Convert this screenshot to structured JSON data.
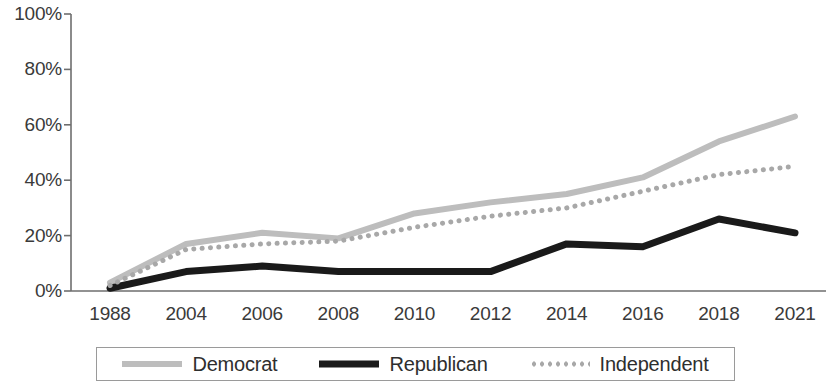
{
  "chart_data": {
    "type": "line",
    "title": "",
    "subtitle": "",
    "xlabel": "",
    "ylabel": "",
    "categories": [
      "1988",
      "2004",
      "2006",
      "2008",
      "2010",
      "2012",
      "2014",
      "2016",
      "2018",
      "2021"
    ],
    "x": [
      1988,
      2004,
      2006,
      2008,
      2010,
      2012,
      2014,
      2016,
      2018,
      2021
    ],
    "ylim": [
      0,
      100
    ],
    "ytick_labels": [
      "0%",
      "20%",
      "40%",
      "60%",
      "80%",
      "100%"
    ],
    "ytick_values": [
      0,
      20,
      40,
      60,
      80,
      100
    ],
    "grid": false,
    "legend_position": "bottom",
    "value_suffix": "%",
    "series": [
      {
        "name": "Democrat",
        "color": "#bdbdbd",
        "style": "solid",
        "width": 6,
        "values": [
          3,
          17,
          21,
          19,
          28,
          32,
          35,
          41,
          54,
          63
        ]
      },
      {
        "name": "Republican",
        "color": "#1a1a1a",
        "style": "solid",
        "width": 7,
        "values": [
          1,
          7,
          9,
          7,
          7,
          7,
          17,
          16,
          26,
          21
        ]
      },
      {
        "name": "Independent",
        "color": "#a8a8a8",
        "style": "dotted",
        "width": 5,
        "values": [
          2,
          15,
          17,
          18,
          23,
          27,
          30,
          36,
          42,
          45
        ]
      }
    ]
  },
  "axes": {
    "axis_color": "#6e6e6e",
    "tick_color": "#6e6e6e"
  },
  "legend": {
    "entries": [
      {
        "label": "Democrat",
        "swatch": "line-solid-light-icon"
      },
      {
        "label": "Republican",
        "swatch": "line-solid-black-icon"
      },
      {
        "label": "Independent",
        "swatch": "line-dotted-gray-icon"
      }
    ]
  }
}
